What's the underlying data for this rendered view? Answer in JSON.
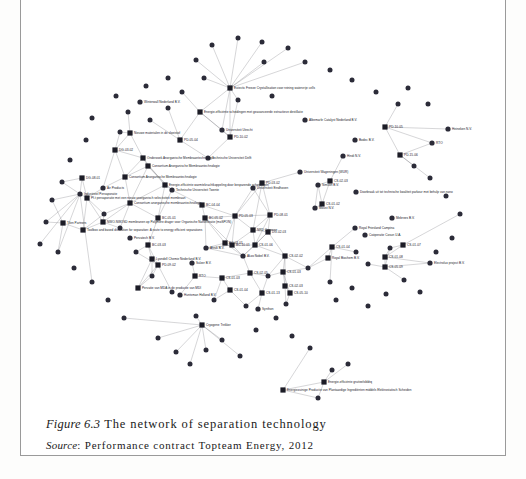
{
  "figure": {
    "number_label": "Figure 6.3",
    "title": "The network of separation technology",
    "source_label": "Source",
    "source_text": ": Performance contract Topteam Energy, 2012"
  },
  "graph": {
    "type": "network",
    "node_shapes": {
      "organization": "circle",
      "project": "square"
    },
    "colors": {
      "node": "#2b2b38",
      "edge": "#55555f",
      "label": "#20202a",
      "background": "#ffffff"
    },
    "counts": {
      "organizations": 78,
      "projects": 46
    },
    "projects": [
      {
        "id": "p1",
        "label": "Eutectic Freeze Crystallisation voor reining watervrije cells",
        "x": 230,
        "y": 88
      },
      {
        "id": "p2",
        "label": "Energie-efficiënte scheidingen met geavanceerde extractieve destillatie",
        "x": 200,
        "y": 112
      },
      {
        "id": "p3",
        "label": "Nieuwe materialen in de vloeistof",
        "x": 130,
        "y": 133
      },
      {
        "id": "p4",
        "label": "PD-05-04",
        "x": 180,
        "y": 140
      },
      {
        "id": "p5",
        "label": "PD-10-02",
        "x": 230,
        "y": 137
      },
      {
        "id": "p6",
        "label": "PD-10-05",
        "x": 385,
        "y": 127
      },
      {
        "id": "p7",
        "label": "PD-15-06",
        "x": 400,
        "y": 155
      },
      {
        "id": "p8",
        "label": "DG-03-02",
        "x": 115,
        "y": 150
      },
      {
        "id": "p9",
        "label": "Onderzoek Anorganische Membraantechnologie",
        "x": 143,
        "y": 158
      },
      {
        "id": "p10",
        "label": "Consortium Anorganische Membraantechnologie",
        "x": 148,
        "y": 166
      },
      {
        "id": "p11",
        "label": "Consortium Anorganische Membraantechnologie",
        "x": 125,
        "y": 177
      },
      {
        "id": "p12",
        "label": "Energie-efficiënte warmtekrachtkoppeling door besparende scheidingen",
        "x": 165,
        "y": 185
      },
      {
        "id": "p13",
        "label": "DG-08-01",
        "x": 82,
        "y": 178
      },
      {
        "id": "p14",
        "label": "PD-03-02",
        "x": 262,
        "y": 183
      },
      {
        "id": "p15",
        "label": "CS-02-03",
        "x": 330,
        "y": 181
      },
      {
        "id": "p16",
        "label": "Consortium anorganische membraantechnologie",
        "x": 130,
        "y": 203
      },
      {
        "id": "p17",
        "label": "BC-04-04",
        "x": 202,
        "y": 205
      },
      {
        "id": "p18",
        "label": "CS-01-02",
        "x": 322,
        "y": 204
      },
      {
        "id": "p19",
        "label": "Pf-t pervaporatie met een nieuw anorganisch selectiviteit membraan",
        "x": 87,
        "y": 198
      },
      {
        "id": "p20",
        "label": "BC-05-01",
        "x": 158,
        "y": 218
      },
      {
        "id": "p21",
        "label": "BC-05-02",
        "x": 205,
        "y": 218
      },
      {
        "id": "p22",
        "label": "PD-05-03",
        "x": 235,
        "y": 216
      },
      {
        "id": "p23",
        "label": "PD-08-01",
        "x": 270,
        "y": 215
      },
      {
        "id": "p24",
        "label": "NWO-NWOSD membranen op Polymere drager voor Organische Nanofiltratie (moSPON)",
        "x": 103,
        "y": 222
      },
      {
        "id": "p25",
        "label": "Toolbox and based distillation for separation: A route to energy efficient separations",
        "x": 83,
        "y": 230
      },
      {
        "id": "p26",
        "label": "Tilen Partners",
        "x": 63,
        "y": 223
      },
      {
        "id": "p27",
        "label": "NRD Cogenen",
        "x": 253,
        "y": 230
      },
      {
        "id": "p28",
        "label": "DG-02-03",
        "x": 268,
        "y": 232
      },
      {
        "id": "p29",
        "label": "BC-03-03",
        "x": 148,
        "y": 245
      },
      {
        "id": "p30",
        "label": "BC-03-01",
        "x": 225,
        "y": 243
      },
      {
        "id": "p31",
        "label": "BC-10-01",
        "x": 232,
        "y": 245
      },
      {
        "id": "p32",
        "label": "CS-01-06",
        "x": 255,
        "y": 245
      },
      {
        "id": "p33",
        "label": "CS-01-07",
        "x": 403,
        "y": 245
      },
      {
        "id": "p34",
        "label": "CS-01-04",
        "x": 332,
        "y": 247
      },
      {
        "id": "p35",
        "label": "Lyondell Chemie Nederland B.V.",
        "x": 152,
        "y": 259
      },
      {
        "id": "p36",
        "label": "PD-09-02",
        "x": 158,
        "y": 265
      },
      {
        "id": "p37",
        "label": "CS-02-02",
        "x": 285,
        "y": 256
      },
      {
        "id": "p38",
        "label": "Royal Biochem B.V.",
        "x": 328,
        "y": 258
      },
      {
        "id": "p39",
        "label": "CS-01-08",
        "x": 385,
        "y": 257
      },
      {
        "id": "p40",
        "label": "CS-05-09",
        "x": 385,
        "y": 267
      },
      {
        "id": "p41",
        "label": "CS-02-05",
        "x": 250,
        "y": 273
      },
      {
        "id": "p42",
        "label": "CS-01-03",
        "x": 283,
        "y": 272
      },
      {
        "id": "p43",
        "label": "RTO",
        "x": 195,
        "y": 276
      },
      {
        "id": "p44",
        "label": "CS-01-03",
        "x": 222,
        "y": 278
      },
      {
        "id": "p45",
        "label": "CS-02-03",
        "x": 285,
        "y": 286
      },
      {
        "id": "p46",
        "label": "CS-01-04",
        "x": 230,
        "y": 290
      },
      {
        "id": "p47",
        "label": "CS-01-13",
        "x": 262,
        "y": 293
      },
      {
        "id": "p48",
        "label": "CS-05-10",
        "x": 290,
        "y": 293
      },
      {
        "id": "p49",
        "label": "Pervatie van MDA in de productie van MDI",
        "x": 138,
        "y": 288
      },
      {
        "id": "p50",
        "label": "Cryogene Trekker",
        "x": 202,
        "y": 325
      },
      {
        "id": "p51",
        "label": "Energie-efficiënte gruiteelsbldrq",
        "x": 324,
        "y": 382
      },
      {
        "id": "p52",
        "label": "Energiezuinige Productie van Plantaardige Ingrediënten middels Elektrostatisch Scheiden",
        "x": 283,
        "y": 390
      }
    ],
    "organizations": [
      {
        "id": "o1",
        "label": "Winterwall Nederland B.V.",
        "x": 140,
        "y": 102
      },
      {
        "id": "o2",
        "label": "Universiteit Utrecht",
        "x": 222,
        "y": 130
      },
      {
        "id": "o3",
        "label": "Albemarle Catalyst Nederland B.V.",
        "x": 305,
        "y": 120
      },
      {
        "id": "o4",
        "label": "Heineken N.V.",
        "x": 448,
        "y": 129
      },
      {
        "id": "o5",
        "label": "RTO",
        "x": 432,
        "y": 143
      },
      {
        "id": "o6",
        "label": "Bodec B.V.",
        "x": 355,
        "y": 140
      },
      {
        "id": "o7",
        "label": "Hindi N.V.",
        "x": 343,
        "y": 156
      },
      {
        "id": "o8",
        "label": "Technische Universiteit Delft",
        "x": 208,
        "y": 158
      },
      {
        "id": "o9",
        "label": "Universiteit Wageningen (WUR)",
        "x": 300,
        "y": 172
      },
      {
        "id": "o10",
        "label": "Universiteit Eindhoven",
        "x": 253,
        "y": 188
      },
      {
        "id": "o11",
        "label": "Technische Universiteit Twente",
        "x": 172,
        "y": 190
      },
      {
        "id": "o12",
        "label": "Simcon B.V.",
        "x": 318,
        "y": 185
      },
      {
        "id": "o13",
        "label": "Doorbraak uit tot technische kwaliteit parkour met behulp van nano",
        "x": 356,
        "y": 192
      },
      {
        "id": "o14",
        "label": "Air Products",
        "x": 103,
        "y": 188
      },
      {
        "id": "o15",
        "label": "Industrieel Pervaporatie",
        "x": 80,
        "y": 194
      },
      {
        "id": "o16",
        "label": "Moust N.V.",
        "x": 315,
        "y": 208
      },
      {
        "id": "o17",
        "label": "Mebrees B.V.",
        "x": 392,
        "y": 218
      },
      {
        "id": "o18",
        "label": "Royal Friesland Campina",
        "x": 355,
        "y": 228
      },
      {
        "id": "o19",
        "label": "Coöperatie Cosun U.A.",
        "x": 365,
        "y": 235
      },
      {
        "id": "o20",
        "label": "Pervatech B.V.",
        "x": 130,
        "y": 238
      },
      {
        "id": "o21",
        "label": "Afvuk B.V.",
        "x": 206,
        "y": 248
      },
      {
        "id": "o22",
        "label": "Akzo Nobel B.V.",
        "x": 243,
        "y": 256
      },
      {
        "id": "o23",
        "label": "Sulzer B.V.",
        "x": 192,
        "y": 263
      },
      {
        "id": "o24",
        "label": "Electrolux project B.V.",
        "x": 430,
        "y": 263
      },
      {
        "id": "o25",
        "label": "Huntsman Holland B.V.",
        "x": 180,
        "y": 295
      },
      {
        "id": "o26",
        "label": "Synthon",
        "x": 258,
        "y": 309
      }
    ]
  }
}
